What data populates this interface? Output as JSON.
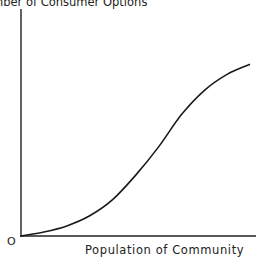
{
  "chart_data": {
    "type": "line",
    "title": "",
    "ylabel": "Number of Consumer Options",
    "ylabel_visible": "mber of Consumer Options",
    "xlabel": "Population of Community",
    "origin_label": "O",
    "xlim": [
      0,
      1
    ],
    "ylim": [
      0,
      1
    ],
    "grid": false,
    "legend": "none",
    "series": [
      {
        "name": "Consumer options vs population",
        "x": [
          0,
          0.1,
          0.2,
          0.3,
          0.4,
          0.5,
          0.6,
          0.7,
          0.8,
          0.9,
          1.0
        ],
        "y": [
          0,
          0.02,
          0.05,
          0.1,
          0.18,
          0.3,
          0.44,
          0.6,
          0.72,
          0.8,
          0.85
        ]
      }
    ]
  }
}
